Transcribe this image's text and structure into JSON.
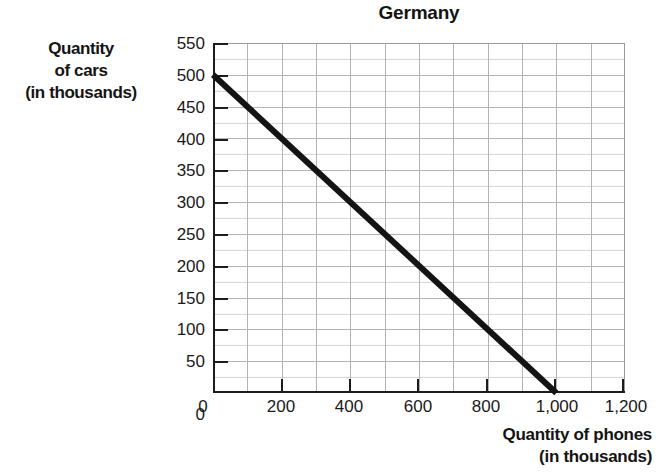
{
  "chart_data": {
    "type": "line",
    "title": "Germany",
    "xlabel": "Quantity of phones (in thousands)",
    "ylabel": "Quantity of cars (in thousands)",
    "xlim": [
      0,
      1200
    ],
    "ylim": [
      0,
      550
    ],
    "grid": true,
    "legend": "none",
    "x_ticks": [
      0,
      200,
      400,
      600,
      800,
      1000,
      1200
    ],
    "x_tick_labels": [
      "0",
      "200",
      "400",
      "600",
      "800",
      "1,000",
      "1,200"
    ],
    "y_ticks": [
      0,
      50,
      100,
      150,
      200,
      250,
      300,
      350,
      400,
      450,
      500,
      550
    ],
    "y_tick_labels": [
      "0",
      "50",
      "100",
      "150",
      "200",
      "250",
      "300",
      "350",
      "400",
      "450",
      "500",
      "550"
    ],
    "series": [
      {
        "name": "Production possibilities frontier",
        "x": [
          0,
          1000
        ],
        "values": [
          500,
          0
        ],
        "color": "#141414",
        "line_width": 6,
        "style": "solid"
      }
    ],
    "annotations": []
  },
  "title": {
    "text": "Germany"
  },
  "y_axis": {
    "caption_lines": [
      "Quantity",
      "of cars",
      "(in thousands)"
    ],
    "tick_labels": [
      "550",
      "500",
      "450",
      "400",
      "350",
      "300",
      "250",
      "200",
      "150",
      "100",
      "50",
      "0"
    ]
  },
  "x_axis": {
    "caption_lines": [
      "Quantity of phones",
      "(in thousands)"
    ],
    "tick_labels": [
      "0",
      "200",
      "400",
      "600",
      "800",
      "1,000",
      "1,200"
    ]
  },
  "colors": {
    "line": "#141414",
    "axis": "#1c1c1c",
    "grid_major": "#b3b3b3",
    "grid_minor": "#9696966b",
    "background": "#ffffff",
    "text": "#1a1a1a"
  }
}
